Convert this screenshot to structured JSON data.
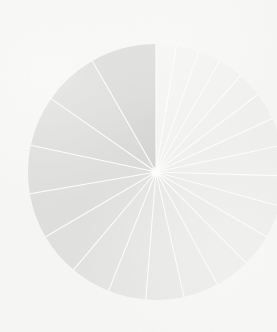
{
  "canvas": {
    "width": 277,
    "height": 332,
    "background_color": "#f4f4f2"
  },
  "figure": {
    "center_x": 156,
    "center_y": 172,
    "radius": 128,
    "divider_color": "#ffffff",
    "divider_width": 1.1,
    "start_angle_deg": 90,
    "direction": "counterclockwise",
    "appearance": "faded"
  },
  "watermark": {
    "visible": false,
    "legible": false,
    "traces": [
      "",
      "",
      "",
      ""
    ]
  },
  "chart_data": {
    "type": "pie",
    "title": "",
    "subtitle": "",
    "xlabel": "",
    "ylabel": "",
    "grid": false,
    "legend_position": "none",
    "annotations": [],
    "tick_labels": [],
    "note": "Values are proportional slice sizes read from wedge angles; shading fades from dark at the 6 o'clock slice counterclockwise toward near-white on the right side.",
    "categories": [
      "Slice 1",
      "Slice 2",
      "Slice 3",
      "Slice 4",
      "Slice 5",
      "Slice 6",
      "Slice 7",
      "Slice 8",
      "Slice 9",
      "Slice 10",
      "Slice 11",
      "Slice 12",
      "Slice 13",
      "Slice 14",
      "Slice 15",
      "Slice 16",
      "Slice 17",
      "Slice 18",
      "Slice 19",
      "Slice 20",
      "Slice 21",
      "Slice 22"
    ],
    "values": [
      26,
      22,
      20,
      19,
      18,
      17,
      16,
      15,
      15,
      14,
      14,
      13,
      13,
      12,
      12,
      11,
      11,
      10,
      10,
      9,
      9,
      8
    ],
    "colors": [
      "#bfbfbd",
      "#c6c6c4",
      "#cacac8",
      "#cececc",
      "#d1d1cf",
      "#d4d4d2",
      "#d7d7d5",
      "#d9d9d7",
      "#dbdbd9",
      "#dddddb",
      "#dfdfdd",
      "#e1e1df",
      "#e3e3e1",
      "#e5e5e3",
      "#e7e7e5",
      "#e8e8e6",
      "#eaeae8",
      "#ebebe9",
      "#ededeb",
      "#eeeeec",
      "#efefed",
      "#f0f0ee"
    ]
  }
}
